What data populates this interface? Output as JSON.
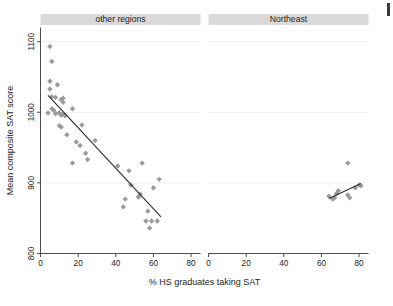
{
  "figure": {
    "background_color": "#ffffff",
    "marker_color": "#9a9a9a",
    "fit_line_color": "#2b2b2b",
    "panel_header_color": "#d9d9d9",
    "axis_color": "#4d4d4d",
    "gridline_color": "#f0f0f0",
    "width": 393,
    "height": 306
  },
  "chart_data": {
    "type": "scatter",
    "title": "",
    "xlabel": "% HS graduates taking SAT",
    "ylabel": "Mean composite SAT score",
    "xlim": [
      0,
      85
    ],
    "ylim": [
      800,
      1120
    ],
    "xticks": [
      0,
      20,
      40,
      60,
      80
    ],
    "yticks": [
      800,
      900,
      1000,
      1100
    ],
    "xtick_labels": [
      "0",
      "20",
      "40",
      "60",
      "80"
    ],
    "ytick_labels": [
      "800",
      "900",
      "1000",
      "1100"
    ],
    "grid": true,
    "grid_axis": "y",
    "legend": "none",
    "panels": [
      {
        "name": "panel-other-regions",
        "label": "other regions",
        "points": [
          {
            "x": 5,
            "y": 1093
          },
          {
            "x": 6,
            "y": 1072
          },
          {
            "x": 5,
            "y": 1044
          },
          {
            "x": 5,
            "y": 1033
          },
          {
            "x": 9,
            "y": 1039
          },
          {
            "x": 4,
            "y": 999
          },
          {
            "x": 6,
            "y": 1022
          },
          {
            "x": 8,
            "y": 1021
          },
          {
            "x": 11,
            "y": 1018
          },
          {
            "x": 12,
            "y": 1020
          },
          {
            "x": 12,
            "y": 1014
          },
          {
            "x": 6,
            "y": 1005
          },
          {
            "x": 7,
            "y": 1003
          },
          {
            "x": 8,
            "y": 998
          },
          {
            "x": 10,
            "y": 999
          },
          {
            "x": 11,
            "y": 996
          },
          {
            "x": 12,
            "y": 997
          },
          {
            "x": 13,
            "y": 995
          },
          {
            "x": 17,
            "y": 1005
          },
          {
            "x": 10,
            "y": 981
          },
          {
            "x": 11,
            "y": 979
          },
          {
            "x": 22,
            "y": 982
          },
          {
            "x": 14,
            "y": 968
          },
          {
            "x": 19,
            "y": 958
          },
          {
            "x": 21,
            "y": 953
          },
          {
            "x": 29,
            "y": 960
          },
          {
            "x": 17,
            "y": 928
          },
          {
            "x": 24,
            "y": 942
          },
          {
            "x": 25,
            "y": 933
          },
          {
            "x": 41,
            "y": 924
          },
          {
            "x": 47,
            "y": 917
          },
          {
            "x": 54,
            "y": 928
          },
          {
            "x": 63,
            "y": 905
          },
          {
            "x": 48,
            "y": 897
          },
          {
            "x": 60,
            "y": 893
          },
          {
            "x": 45,
            "y": 877
          },
          {
            "x": 52,
            "y": 880
          },
          {
            "x": 53,
            "y": 884
          },
          {
            "x": 44,
            "y": 866
          },
          {
            "x": 57,
            "y": 860
          },
          {
            "x": 56,
            "y": 846
          },
          {
            "x": 59,
            "y": 846
          },
          {
            "x": 62,
            "y": 846
          },
          {
            "x": 58,
            "y": 836
          }
        ],
        "fit_line": {
          "x1": 4,
          "y1": 1024,
          "x2": 64,
          "y2": 852
        }
      },
      {
        "name": "panel-northeast",
        "label": "Northeast",
        "points": [
          {
            "x": 74,
            "y": 928
          },
          {
            "x": 64,
            "y": 881
          },
          {
            "x": 66,
            "y": 877
          },
          {
            "x": 67,
            "y": 879
          },
          {
            "x": 68,
            "y": 885
          },
          {
            "x": 69,
            "y": 889
          },
          {
            "x": 74,
            "y": 883
          },
          {
            "x": 75,
            "y": 879
          },
          {
            "x": 78,
            "y": 893
          },
          {
            "x": 80,
            "y": 897
          },
          {
            "x": 81,
            "y": 896
          }
        ],
        "fit_line": {
          "x1": 64,
          "y1": 878,
          "x2": 81,
          "y2": 899
        }
      }
    ]
  }
}
